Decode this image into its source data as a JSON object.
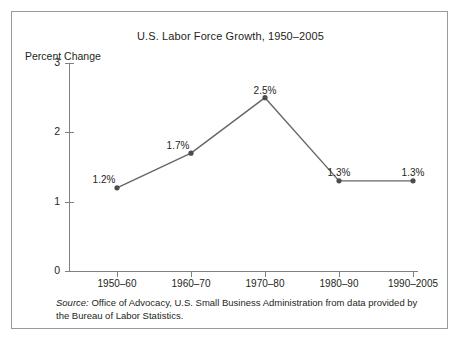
{
  "figure": {
    "title": "U.S. Labor Force Growth, 1950–2005",
    "y_axis_label": "Percent Change",
    "source_prefix": "Source:",
    "source_text": " Office of Advocacy, U.S. Small Business Administration from data provided by the Bureau of Labor Statistics.",
    "border_color": "#9a9a9a",
    "background_color": "#ffffff"
  },
  "chart_data": {
    "type": "line",
    "title": "U.S. Labor Force Growth, 1950–2005",
    "xlabel": "",
    "ylabel": "Percent Change",
    "categories": [
      "1950–60",
      "1960–70",
      "1970–80",
      "1980–90",
      "1990–2005"
    ],
    "values": [
      1.2,
      1.7,
      2.5,
      1.3,
      1.3
    ],
    "point_labels": [
      "1.2%",
      "1.7%",
      "2.5%",
      "1.3%",
      "1.3%"
    ],
    "ylim": [
      0,
      3
    ],
    "yticks": [
      0,
      1,
      2,
      3
    ],
    "ytick_labels": [
      "0",
      "1",
      "2",
      "3"
    ],
    "grid": false,
    "legend": false,
    "line_color": "#666666",
    "marker_color": "#4d4d4d",
    "marker_shape": "circle",
    "axis_color": "#808080"
  }
}
